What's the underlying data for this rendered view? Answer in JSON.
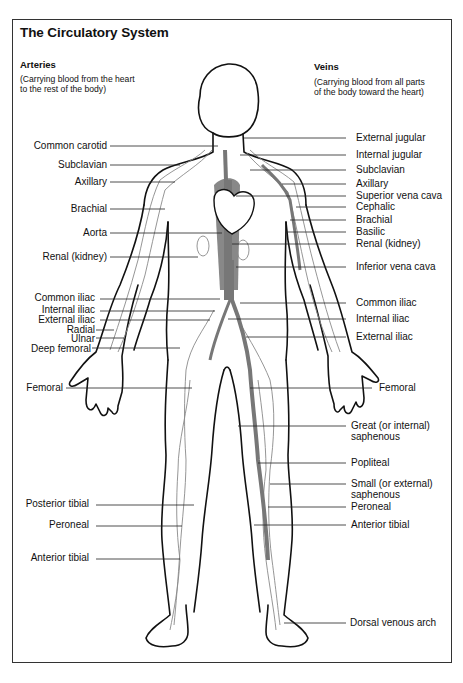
{
  "title": "The Circulatory System",
  "arteries": {
    "heading": "Arteries",
    "description_lines": [
      "(Carrying blood from the heart",
      "to the rest of the body)"
    ]
  },
  "veins": {
    "heading": "Veins",
    "description_lines": [
      "(Carrying blood from all parts",
      "of the body toward the heart)"
    ]
  },
  "artery_labels": [
    {
      "text": "Common carotid",
      "y": 146
    },
    {
      "text": "Subclavian",
      "y": 165
    },
    {
      "text": "Axillary",
      "y": 182
    },
    {
      "text": "Brachial",
      "y": 209
    },
    {
      "text": "Aorta",
      "y": 233
    },
    {
      "text": "Renal (kidney)",
      "y": 257
    },
    {
      "text": "Common iliac",
      "y": 297
    },
    {
      "text": "Internal iliac",
      "y": 309
    },
    {
      "text": "External iliac",
      "y": 320
    },
    {
      "text": "Radial",
      "y": 330
    },
    {
      "text": "Ulnar",
      "y": 339
    },
    {
      "text": "Deep femoral",
      "y": 349
    },
    {
      "text": "Femoral",
      "y": 387
    },
    {
      "text": "Posterior tibial",
      "y": 504
    },
    {
      "text": "Peroneal",
      "y": 525
    },
    {
      "text": "Anterior tibial",
      "y": 558
    }
  ],
  "vein_labels": [
    {
      "text": "External jugular",
      "lines": [
        "External jugular"
      ],
      "y": 138
    },
    {
      "text": "Internal jugular",
      "lines": [
        "Internal jugular"
      ],
      "y": 155
    },
    {
      "text": "Subclavian",
      "lines": [
        "Subclavian"
      ],
      "y": 170
    },
    {
      "text": "Axillary",
      "lines": [
        "Axillary"
      ],
      "y": 184
    },
    {
      "text": "Superior vena cava",
      "lines": [
        "Superior vena cava"
      ],
      "y": 196
    },
    {
      "text": "Cephalic",
      "lines": [
        "Cephalic"
      ],
      "y": 207
    },
    {
      "text": "Brachial",
      "lines": [
        "Brachial"
      ],
      "y": 220
    },
    {
      "text": "Basilic",
      "lines": [
        "Basilic"
      ],
      "y": 232
    },
    {
      "text": "Renal (kidney)",
      "lines": [
        "Renal (kidney)"
      ],
      "y": 244
    },
    {
      "text": "Inferior vena cava",
      "lines": [
        "Inferior vena cava"
      ],
      "y": 267
    },
    {
      "text": "Common iliac",
      "lines": [
        "Common iliac"
      ],
      "y": 303
    },
    {
      "text": "Internal iliac",
      "lines": [
        "Internal iliac"
      ],
      "y": 319
    },
    {
      "text": "External iliac",
      "lines": [
        "External iliac"
      ],
      "y": 337
    },
    {
      "text": "Femoral",
      "lines": [
        "Femoral"
      ],
      "y": 388
    },
    {
      "text": "Great (or internal) saphenous",
      "lines": [
        "Great (or internal)",
        "saphenous"
      ],
      "y": 426
    },
    {
      "text": "Popliteal",
      "lines": [
        "Popliteal"
      ],
      "y": 463
    },
    {
      "text": "Small (or external) saphenous",
      "lines": [
        "Small (or external)",
        "saphenous"
      ],
      "y": 484
    },
    {
      "text": "Peroneal",
      "lines": [
        "Peroneal"
      ],
      "y": 507
    },
    {
      "text": "Anterior tibial",
      "lines": [
        "Anterior tibial"
      ],
      "y": 525
    },
    {
      "text": "Dorsal venous arch",
      "lines": [
        "Dorsal venous arch"
      ],
      "y": 623
    }
  ],
  "colors": {
    "outline": "#111111",
    "vein_fill": "#808080",
    "vessel_line": "#8a8a8a",
    "leader_line": "#222222",
    "frame": "#333333"
  }
}
